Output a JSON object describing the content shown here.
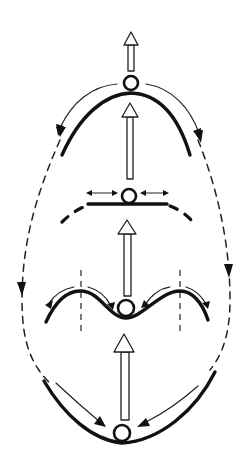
{
  "diagram": {
    "title": "",
    "stages": [
      {
        "id": "unstable",
        "surface": "hilltop",
        "ball_tendency": "rolls away to both sides"
      },
      {
        "id": "neutral",
        "surface": "flat",
        "ball_tendency": "moves freely left and right"
      },
      {
        "id": "metastable",
        "surface": "valley between two hills",
        "ball_tendency": "returns to centre within barriers"
      },
      {
        "id": "stable",
        "surface": "bowl",
        "ball_tendency": "returns to the bottom"
      }
    ],
    "transition_arrows": 4,
    "loop": {
      "style": "dashed",
      "direction": "downward on both sides"
    },
    "colors": {
      "stroke": "#111111",
      "background": "#ffffff"
    }
  }
}
